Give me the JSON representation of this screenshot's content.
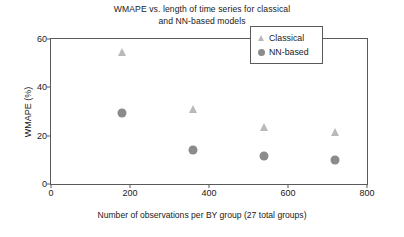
{
  "chart_data": {
    "type": "scatter",
    "title": "WMAPE vs. length of time series for classical and NN-based models",
    "title_lines": [
      "WMAPE vs. length of time series for classical",
      "and NN-based models"
    ],
    "xlabel": "Number of observations per BY group (27 total groups)",
    "ylabel": "WMAPE (%)",
    "xlim": [
      0,
      800
    ],
    "ylim": [
      0,
      60
    ],
    "xticks": [
      0,
      200,
      400,
      600,
      800
    ],
    "xtick_labels": [
      "0",
      "200",
      "400",
      "600",
      "800"
    ],
    "yticks": [
      0,
      20,
      40,
      60
    ],
    "ytick_labels": [
      "0",
      "20",
      "40",
      "60"
    ],
    "grid": false,
    "legend_position": "upper right",
    "series": [
      {
        "name": "Classical",
        "marker": "triangle",
        "color": "#b9b9b9",
        "x": [
          180,
          360,
          540,
          720
        ],
        "y": [
          54.5,
          31.0,
          23.5,
          21.5
        ]
      },
      {
        "name": "NN-based",
        "marker": "circle",
        "color": "#8b8b8b",
        "x": [
          180,
          360,
          540,
          720
        ],
        "y": [
          29.5,
          14.0,
          11.5,
          10.0
        ]
      }
    ]
  },
  "legend": {
    "entries": [
      {
        "label": "Classical",
        "marker": "triangle"
      },
      {
        "label": "NN-based",
        "marker": "circle"
      }
    ]
  },
  "colors": {
    "axis": "#5a5a5a",
    "text": "#1a1a1a",
    "background": "#ffffff",
    "classical_marker": "#b9b9b9",
    "nn_marker": "#8b8b8b"
  }
}
